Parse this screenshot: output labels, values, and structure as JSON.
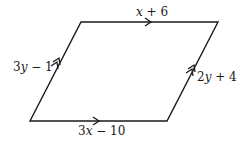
{
  "diagram": {
    "shape": "parallelogram",
    "colors": {
      "stroke": "#1a1a1a",
      "background": "#ffffff"
    },
    "sides": {
      "top": {
        "var": "x",
        "rest": " + 6",
        "marks": 1
      },
      "bottom": {
        "coef": "3",
        "var": "x",
        "rest": " − 10",
        "marks": 1
      },
      "left": {
        "coef": "3",
        "var": "y",
        "rest": " − 1",
        "marks": 2
      },
      "right": {
        "coef": "2",
        "var": "y",
        "rest": " + 4",
        "marks": 2
      }
    }
  }
}
